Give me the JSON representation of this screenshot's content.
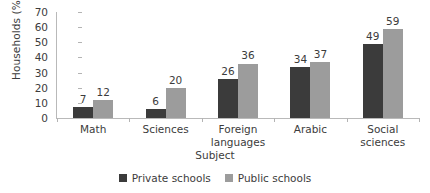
{
  "chart_data": {
    "type": "bar",
    "title": "",
    "xlabel": "Subject",
    "ylabel": "Households (%)",
    "ylim": [
      0,
      70
    ],
    "ytick_step": 10,
    "yticks": [
      "0",
      "10",
      "20",
      "30",
      "40",
      "50",
      "60",
      "70"
    ],
    "grid": false,
    "legend_position": "bottom-center",
    "categories": [
      "Math",
      "Sciences",
      "Foreign languages",
      "Arabic",
      "Social sciences"
    ],
    "category_lines": [
      [
        "Math"
      ],
      [
        "Sciences"
      ],
      [
        "Foreign",
        "languages"
      ],
      [
        "Arabic"
      ],
      [
        "Social",
        "sciences"
      ]
    ],
    "series": [
      {
        "name": "Private schools",
        "color": "#3b3b3b",
        "values": [
          7,
          6,
          26,
          34,
          49
        ]
      },
      {
        "name": "Public schools",
        "color": "#9c9c9c",
        "values": [
          12,
          20,
          36,
          37,
          59
        ]
      }
    ]
  },
  "legend": {
    "items": [
      {
        "label": "Private schools"
      },
      {
        "label": "Public schools"
      }
    ]
  },
  "axes": {
    "y_title": "Households (%)",
    "x_title": "Subject"
  },
  "colors": {
    "private": "#3b3b3b",
    "public": "#9c9c9c",
    "axis": "#b9b9b9",
    "text": "#3c3c3c",
    "background": "#ffffff"
  }
}
